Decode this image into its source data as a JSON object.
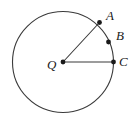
{
  "figure": {
    "type": "circle-with-radii",
    "background_color": "#ffffff",
    "stroke_color": "#3a3a3a",
    "point_color": "#1a1a1a",
    "label_color": "#1a1a1a",
    "canvas": {
      "width": 136,
      "height": 128
    },
    "circle": {
      "cx": 63,
      "cy": 62,
      "r": 50.5,
      "stroke_width": 1.1
    },
    "center": {
      "id": "Q",
      "label": "Q",
      "x": 63,
      "y": 62,
      "label_x": 52,
      "label_y": 66
    },
    "points": [
      {
        "id": "A",
        "label": "A",
        "x": 99.5,
        "y": 22.5,
        "label_x": 111,
        "label_y": 17
      },
      {
        "id": "B",
        "label": "B",
        "x": 108.5,
        "y": 42.0,
        "label_x": 121,
        "label_y": 37
      },
      {
        "id": "C",
        "label": "C",
        "x": 113.5,
        "y": 62.0,
        "label_x": 124,
        "label_y": 63
      }
    ],
    "radii": [
      {
        "id": "QA",
        "from": "Q",
        "to": "A",
        "x1": 63,
        "y1": 62,
        "x2": 99.5,
        "y2": 22.5
      },
      {
        "id": "QC",
        "from": "Q",
        "to": "C",
        "x1": 63,
        "y1": 62,
        "x2": 113.5,
        "y2": 62
      }
    ],
    "dot_radius": 2.4
  }
}
